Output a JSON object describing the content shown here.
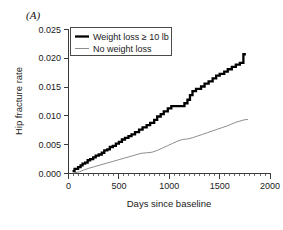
{
  "figure": {
    "panel_label": "(A)",
    "background_color": "#ffffff"
  },
  "chart_data": {
    "type": "line",
    "subtype": "step",
    "title": "",
    "panel_label": "(A)",
    "xlabel": "Days since baseline",
    "ylabel": "Hip fracture rate",
    "xlim": [
      0,
      2000
    ],
    "ylim": [
      0.0,
      0.025
    ],
    "xticks": [
      0,
      500,
      1000,
      1500,
      2000
    ],
    "xtick_labels": [
      "0",
      "500",
      "1000",
      "1500",
      "2000"
    ],
    "yticks": [
      0.0,
      0.005,
      0.01,
      0.015,
      0.02,
      0.025
    ],
    "ytick_labels": [
      "0.000",
      "0.005",
      "0.010",
      "0.015",
      "0.020",
      "0.025"
    ],
    "x_minor_tick_interval": 50,
    "grid": false,
    "frame": "left-bottom",
    "legend_position": "top-left-inside",
    "series": [
      {
        "name": "Weight loss ≥ 10 lb",
        "color": "#000000",
        "line_width": "thick",
        "final_value": 0.0207,
        "points": [
          [
            40,
            0.0004
          ],
          [
            60,
            0.0004
          ],
          [
            60,
            0.0008
          ],
          [
            95,
            0.0008
          ],
          [
            95,
            0.0011
          ],
          [
            120,
            0.0011
          ],
          [
            120,
            0.0014
          ],
          [
            140,
            0.0014
          ],
          [
            140,
            0.0017
          ],
          [
            165,
            0.0017
          ],
          [
            165,
            0.0019
          ],
          [
            190,
            0.0019
          ],
          [
            190,
            0.0023
          ],
          [
            215,
            0.0023
          ],
          [
            215,
            0.0025
          ],
          [
            245,
            0.0025
          ],
          [
            245,
            0.0028
          ],
          [
            270,
            0.0028
          ],
          [
            270,
            0.0031
          ],
          [
            300,
            0.0031
          ],
          [
            300,
            0.0033
          ],
          [
            330,
            0.0033
          ],
          [
            330,
            0.0036
          ],
          [
            355,
            0.0036
          ],
          [
            355,
            0.004
          ],
          [
            385,
            0.004
          ],
          [
            385,
            0.0042
          ],
          [
            410,
            0.0042
          ],
          [
            410,
            0.0046
          ],
          [
            440,
            0.0046
          ],
          [
            440,
            0.0048
          ],
          [
            470,
            0.0048
          ],
          [
            470,
            0.0052
          ],
          [
            500,
            0.0052
          ],
          [
            500,
            0.0055
          ],
          [
            530,
            0.0055
          ],
          [
            530,
            0.0059
          ],
          [
            560,
            0.0059
          ],
          [
            560,
            0.0062
          ],
          [
            595,
            0.0062
          ],
          [
            595,
            0.0065
          ],
          [
            625,
            0.0065
          ],
          [
            625,
            0.0068
          ],
          [
            660,
            0.0068
          ],
          [
            660,
            0.0072
          ],
          [
            700,
            0.0072
          ],
          [
            700,
            0.0076
          ],
          [
            735,
            0.0076
          ],
          [
            735,
            0.008
          ],
          [
            775,
            0.008
          ],
          [
            775,
            0.0084
          ],
          [
            810,
            0.0084
          ],
          [
            810,
            0.0088
          ],
          [
            850,
            0.0088
          ],
          [
            850,
            0.0093
          ],
          [
            880,
            0.0093
          ],
          [
            880,
            0.0099
          ],
          [
            915,
            0.0099
          ],
          [
            915,
            0.0103
          ],
          [
            945,
            0.0103
          ],
          [
            945,
            0.0108
          ],
          [
            985,
            0.0108
          ],
          [
            985,
            0.0113
          ],
          [
            1020,
            0.0113
          ],
          [
            1020,
            0.0117
          ],
          [
            1150,
            0.0117
          ],
          [
            1150,
            0.0122
          ],
          [
            1180,
            0.0122
          ],
          [
            1180,
            0.0128
          ],
          [
            1205,
            0.0128
          ],
          [
            1205,
            0.0136
          ],
          [
            1230,
            0.0136
          ],
          [
            1230,
            0.0143
          ],
          [
            1265,
            0.0143
          ],
          [
            1265,
            0.0147
          ],
          [
            1315,
            0.0147
          ],
          [
            1315,
            0.0151
          ],
          [
            1350,
            0.0151
          ],
          [
            1350,
            0.0156
          ],
          [
            1390,
            0.0156
          ],
          [
            1390,
            0.016
          ],
          [
            1430,
            0.016
          ],
          [
            1430,
            0.0165
          ],
          [
            1465,
            0.0165
          ],
          [
            1465,
            0.017
          ],
          [
            1500,
            0.017
          ],
          [
            1500,
            0.0173
          ],
          [
            1545,
            0.0173
          ],
          [
            1545,
            0.0177
          ],
          [
            1580,
            0.0177
          ],
          [
            1580,
            0.0181
          ],
          [
            1620,
            0.0181
          ],
          [
            1620,
            0.0185
          ],
          [
            1660,
            0.0185
          ],
          [
            1660,
            0.0189
          ],
          [
            1700,
            0.0189
          ],
          [
            1700,
            0.0192
          ],
          [
            1735,
            0.0192
          ],
          [
            1735,
            0.0207
          ],
          [
            1760,
            0.0207
          ]
        ]
      },
      {
        "name": "No weight loss",
        "color": "#8d8d8d",
        "line_width": "thin",
        "final_value": 0.0094,
        "points": [
          [
            55,
            0.0001
          ],
          [
            110,
            0.0003
          ],
          [
            150,
            0.0006
          ],
          [
            200,
            0.0009
          ],
          [
            260,
            0.0012
          ],
          [
            320,
            0.0015
          ],
          [
            380,
            0.0018
          ],
          [
            440,
            0.0021
          ],
          [
            500,
            0.0024
          ],
          [
            560,
            0.0027
          ],
          [
            620,
            0.003
          ],
          [
            680,
            0.0033
          ],
          [
            720,
            0.0035
          ],
          [
            780,
            0.0036
          ],
          [
            830,
            0.0037
          ],
          [
            880,
            0.004
          ],
          [
            930,
            0.0044
          ],
          [
            980,
            0.0048
          ],
          [
            1030,
            0.0052
          ],
          [
            1080,
            0.0056
          ],
          [
            1130,
            0.0059
          ],
          [
            1180,
            0.006
          ],
          [
            1230,
            0.0062
          ],
          [
            1280,
            0.0065
          ],
          [
            1330,
            0.0068
          ],
          [
            1380,
            0.0071
          ],
          [
            1430,
            0.0074
          ],
          [
            1480,
            0.0077
          ],
          [
            1530,
            0.008
          ],
          [
            1580,
            0.0083
          ],
          [
            1620,
            0.0086
          ],
          [
            1660,
            0.0089
          ],
          [
            1700,
            0.0091
          ],
          [
            1740,
            0.0093
          ],
          [
            1780,
            0.0094
          ]
        ]
      }
    ],
    "legend": [
      {
        "label": "Weight loss ≥ 10 lb",
        "color": "#000000",
        "style": "thick"
      },
      {
        "label": "No weight loss",
        "color": "#8d8d8d",
        "style": "thin"
      }
    ]
  }
}
